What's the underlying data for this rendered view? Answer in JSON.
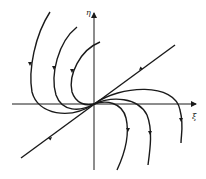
{
  "diagram": {
    "type": "phase-portrait",
    "axes": {
      "x_label": "ξ",
      "y_label": "η"
    },
    "colors": {
      "stroke": "#1a1a1a",
      "background": "#ffffff"
    },
    "elements": [
      {
        "name": "straight-line-trajectory",
        "description": "diagonal line through origin"
      },
      {
        "name": "left-trajectories",
        "count": 3
      },
      {
        "name": "right-trajectories",
        "count": 3
      }
    ]
  }
}
